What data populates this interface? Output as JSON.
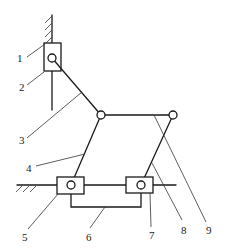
{
  "diagram": {
    "type": "mechanism schematic",
    "colors": {
      "stroke": "#1a1a1a",
      "background": "#ffffff"
    },
    "labels": {
      "l1": "1",
      "l2": "2",
      "l3": "3",
      "l4": "4",
      "l5": "5",
      "l6": "6",
      "l7": "7",
      "l8": "8",
      "l9": "9"
    },
    "parts": [
      {
        "id": "1",
        "name": "vertical fixed frame (ground)"
      },
      {
        "id": "2",
        "name": "vertical slider block"
      },
      {
        "id": "3",
        "name": "upper link"
      },
      {
        "id": "4",
        "name": "left link"
      },
      {
        "id": "5",
        "name": "left horizontal slider block"
      },
      {
        "id": "6",
        "name": "connecting bracket"
      },
      {
        "id": "7",
        "name": "right horizontal slider block"
      },
      {
        "id": "8",
        "name": "right link"
      },
      {
        "id": "9",
        "name": "top horizontal link"
      }
    ]
  }
}
